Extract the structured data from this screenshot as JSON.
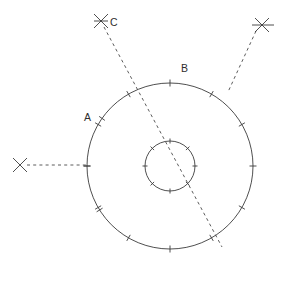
{
  "figure": {
    "canvas": {
      "width": 284,
      "height": 283,
      "background": "#ffffff"
    },
    "stroke_color": "#3b3b3b",
    "dash_color": "#4a4a4a",
    "text_color": "#2e2e2e",
    "center": {
      "x": 170,
      "y": 166
    },
    "circles": [
      {
        "name": "outer-circle",
        "radius": 83,
        "tick_count": 12,
        "tick_length": 7
      },
      {
        "name": "inner-circle",
        "radius": 25,
        "tick_count": 8,
        "tick_length": 5
      }
    ],
    "labels": [
      {
        "id": "A",
        "text": "A",
        "x": 84,
        "y": 121
      },
      {
        "id": "B",
        "text": "B",
        "x": 181,
        "y": 72
      },
      {
        "id": "C",
        "text": "C",
        "x": 110,
        "y": 26
      }
    ],
    "markers": [
      {
        "id": "x-left",
        "x": 20,
        "y": 165,
        "size": 7
      },
      {
        "id": "x-top-left",
        "x": 101,
        "y": 21,
        "size": 7
      },
      {
        "id": "x-top-right",
        "x": 262,
        "y": 25,
        "size": 7
      }
    ],
    "dashed_lines": [
      {
        "id": "sight-line-left",
        "x1": 27,
        "y1": 165,
        "x2": 88,
        "y2": 165
      },
      {
        "id": "sight-line-c",
        "x1": 104,
        "y1": 27,
        "x2": 222,
        "y2": 247
      },
      {
        "id": "sight-line-top-right",
        "x1": 256,
        "y1": 31,
        "x2": 228,
        "y2": 92
      }
    ]
  }
}
